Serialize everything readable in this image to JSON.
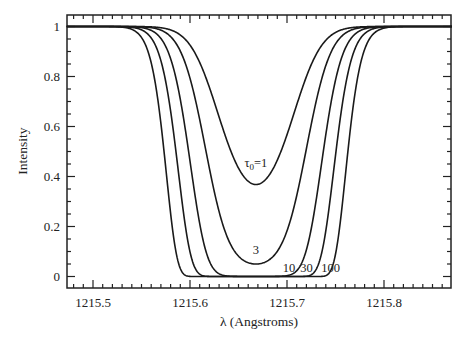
{
  "chart_data": {
    "type": "line",
    "title": "",
    "xlabel": "λ (Angstroms)",
    "ylabel": "Intensity",
    "xlim": [
      1215.473,
      1215.87
    ],
    "ylim": [
      0,
      1
    ],
    "x_ticks": [
      1215.5,
      1215.6,
      1215.7,
      1215.8
    ],
    "x_tick_labels": [
      "1215.5",
      "1215.6",
      "1215.7",
      "1215.8"
    ],
    "y_ticks": [
      0,
      0.2,
      0.4,
      0.6,
      0.8,
      1
    ],
    "y_tick_labels": [
      "0",
      "0.2",
      "0.4",
      "0.6",
      "0.8",
      "1"
    ],
    "x_minor_step": 0.01,
    "y_minor_step": 0.05,
    "grid": false,
    "legend": "inline labels",
    "model": {
      "formula": "I = exp(-tau0 * exp(-((lambda - center)/sigma)^2))",
      "center": 1215.668,
      "sigma": 0.0425
    },
    "series": [
      {
        "name": "τ0=1",
        "tau0": 1,
        "min_intensity": 0.37,
        "label": "τ0=1"
      },
      {
        "name": "3",
        "tau0": 3,
        "min_intensity": 0.05,
        "label": "3"
      },
      {
        "name": "10",
        "tau0": 10,
        "min_intensity": 0.0,
        "label": "10"
      },
      {
        "name": "30",
        "tau0": 30,
        "min_intensity": 0.0,
        "label": "30"
      },
      {
        "name": "100",
        "tau0": 100,
        "min_intensity": 0.0,
        "label": "100"
      }
    ],
    "annotations": [
      {
        "text": "τ0=1",
        "x": 1215.668,
        "y": 0.44
      },
      {
        "text": "3",
        "x": 1215.668,
        "y": 0.09
      },
      {
        "text": "10",
        "x": 1215.702,
        "y": 0.02
      },
      {
        "text": "30",
        "x": 1215.72,
        "y": 0.02
      },
      {
        "text": "100",
        "x": 1215.745,
        "y": 0.02
      }
    ]
  }
}
